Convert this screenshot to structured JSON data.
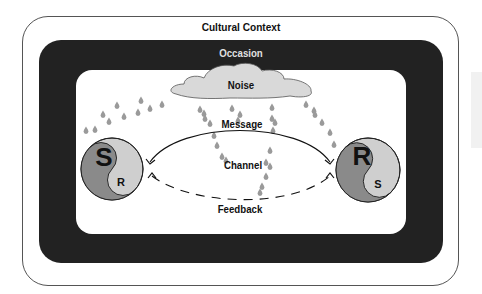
{
  "diagram": {
    "layers": {
      "outer": "Cultural Context",
      "middle": "Occasion"
    },
    "elements": {
      "noise": "Noise",
      "message": "Message",
      "channel": "Channel",
      "feedback": "Feedback"
    },
    "participants": {
      "left": {
        "primary": "S",
        "secondary": "R"
      },
      "right": {
        "primary": "R",
        "secondary": "S"
      }
    },
    "colors": {
      "occasion_band": "#222222",
      "cloud": "#d9d9d9",
      "dark_half": "#8a8a8a",
      "light_half": "#cfcfcf",
      "raindrops": "#9a9a9a"
    }
  }
}
